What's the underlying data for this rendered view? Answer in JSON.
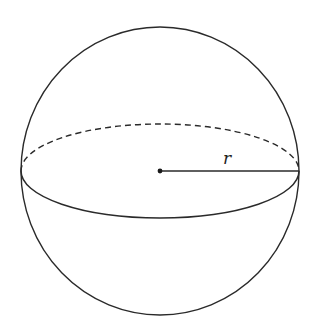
{
  "figure": {
    "stroke_color": "#2a2a2a",
    "background": "#ffffff",
    "sphere": {
      "cx": 160,
      "cy": 171,
      "rx": 139,
      "ry": 144
    },
    "equator": {
      "cx": 160,
      "cy": 171,
      "rx": 139,
      "ry": 47,
      "back_style": "dashed",
      "front_style": "solid"
    },
    "center_point": {
      "x": 160,
      "y": 171
    },
    "radius_line": {
      "x1": 160,
      "y1": 171,
      "x2": 299,
      "y2": 171
    },
    "radius_label": "r"
  }
}
